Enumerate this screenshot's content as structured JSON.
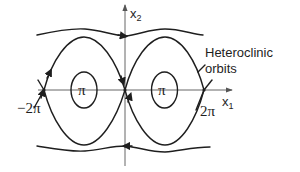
{
  "diagram": {
    "type": "phase-portrait",
    "axes": {
      "x_label": "x",
      "x_subscript": "1",
      "y_label": "x",
      "y_subscript": "2"
    },
    "tick_labels": {
      "neg_two_pi": "−2π",
      "two_pi": "2π",
      "pi_left": "π",
      "pi_right": "π"
    },
    "annotation": {
      "line1": "Heteroclinic",
      "line2": "orbits"
    },
    "colors": {
      "stroke": "#1e1e1e",
      "axis": "#555555",
      "background": "#ffffff"
    },
    "equilibria": {
      "saddles": [
        "-2π",
        "0",
        "2π"
      ],
      "centers": [
        "-π",
        "π"
      ]
    }
  }
}
